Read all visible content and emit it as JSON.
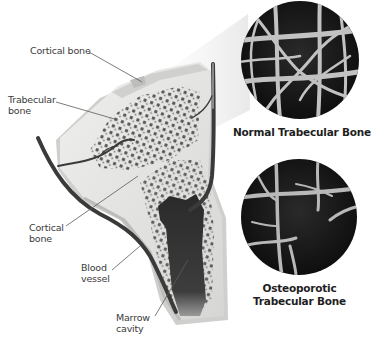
{
  "figure": {
    "labels": {
      "cortical_bone_top": "Cortical bone",
      "trabecular_bone": [
        "Trabecular",
        "bone"
      ],
      "cortical_bone_side": [
        "Cortical",
        "bone"
      ],
      "blood_vessel": [
        "Blood",
        "vessel"
      ],
      "marrow_cavity": [
        "Marrow",
        "cavity"
      ]
    },
    "insets": [
      {
        "id": "normal",
        "caption": [
          "Normal Trabecular Bone"
        ]
      },
      {
        "id": "osteoporotic",
        "caption": [
          "Osteoporotic",
          "Trabecular Bone"
        ]
      }
    ],
    "colors": {
      "background": "#ffffff",
      "bone_surface": "#e4e4e2",
      "bone_shadow": "#c9c9c7",
      "trabecular_dots": "#4a4a4a",
      "marrow": "#2f2f2f",
      "vessel": "#3a3a3a",
      "label_text": "#3a3a3a",
      "caption_text": "#1e1e1e",
      "inset_bg": "#111111",
      "inset_struts": "#bdbdbd"
    }
  }
}
